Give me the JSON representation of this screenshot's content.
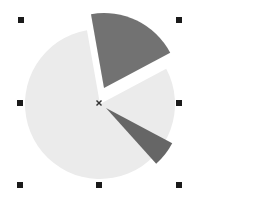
{
  "chart_data": {
    "type": "pie",
    "title": "",
    "exploded": true,
    "center": [
      100,
      104
    ],
    "radius": 75,
    "slices": [
      {
        "label": "Slice 1",
        "value": 20.0,
        "start_deg": -100,
        "end_deg": -28,
        "offset": [
          4,
          -16
        ],
        "color": "#727272"
      },
      {
        "label": "Slice 2",
        "value": 5.5,
        "start_deg": 28,
        "end_deg": 48,
        "offset": [
          6,
          4
        ],
        "color": "#666666"
      },
      {
        "label": "Slice 3",
        "value": 74.5,
        "start_deg": -28,
        "end_deg": 260,
        "offset": [
          0,
          0
        ],
        "color": "#ebebeb"
      }
    ],
    "legend": [],
    "grid": false
  },
  "selection": {
    "handle_color": "#1a1a1a",
    "handles": [
      {
        "name": "top-left",
        "x": 18,
        "y": 17
      },
      {
        "name": "top-right",
        "x": 176,
        "y": 17
      },
      {
        "name": "middle-left",
        "x": 17,
        "y": 100
      },
      {
        "name": "middle-right",
        "x": 176,
        "y": 100
      },
      {
        "name": "bottom-left",
        "x": 17,
        "y": 182
      },
      {
        "name": "bottom-center",
        "x": 96,
        "y": 182
      },
      {
        "name": "bottom-right",
        "x": 176,
        "y": 182
      }
    ],
    "center_marker": {
      "x": 99,
      "y": 103,
      "glyph": "×"
    }
  }
}
